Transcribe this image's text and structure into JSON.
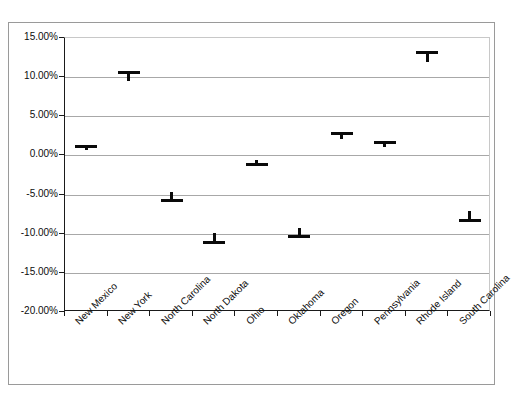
{
  "chart_data": {
    "type": "scatter",
    "title": "",
    "subtitle": "",
    "xlabel": "",
    "ylabel": "",
    "categories": [
      "New Mexico",
      "New York",
      "North Carolina",
      "North Dakota",
      "Ohio",
      "Oklahoma",
      "Oregon",
      "Pennsylvania",
      "Rhode Island",
      "South Carolina"
    ],
    "values": [
      1.2,
      10.6,
      -5.8,
      -11.1,
      -1.1,
      -10.4,
      2.8,
      1.7,
      13.1,
      -8.3
    ],
    "value_format": "percent",
    "ylim": [
      -20,
      15
    ],
    "ytick_values": [
      15,
      10,
      5,
      0,
      -5,
      -10,
      -15,
      -20
    ],
    "ytick_labels": [
      "15.00%",
      "10.00%",
      "5.00%",
      "0.00%",
      "-5.00%",
      "-10.00%",
      "-15.00%",
      "-20.00%"
    ],
    "grid": true,
    "legend": false,
    "legend_position": "none",
    "marker_style": "horizontal-cap-with-stem",
    "series_color": "#0a0a0a",
    "gridline_color": "#a8a8a8",
    "axis_color": "#1a1a1a",
    "frame_color": "#9a9a9a",
    "background_color": "#ffffff"
  }
}
